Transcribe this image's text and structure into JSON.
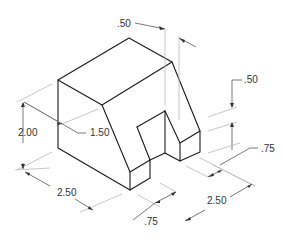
{
  "drawing": {
    "type": "isometric-dimensioned-part",
    "colors": {
      "object_line": "#1a1a1a",
      "dimension_line": "#b8b8b8",
      "text": "#333333"
    },
    "dimensions": {
      "top_notch_width": ".50",
      "right_step_height": ".50",
      "right_leg_depth": ".75",
      "overall_height": "2.00",
      "top_setback": "1.50",
      "left_width": "2.50",
      "slot_width": ".75",
      "right_depth": "2.50"
    }
  }
}
